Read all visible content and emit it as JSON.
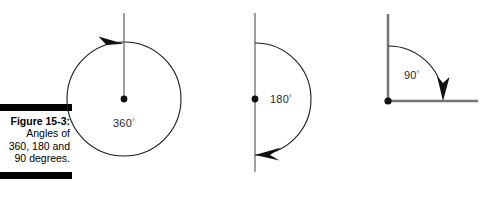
{
  "caption": {
    "title": "Figure 15-3:",
    "lines": [
      "Angles of",
      "360, 180 and",
      "90 degrees."
    ],
    "rule_color": "#000000"
  },
  "figures": [
    {
      "id": "figure-360",
      "name": "full-circle-360",
      "label": "360",
      "degree_symbol": "°",
      "description": "Full circle with vertical radius, center point and clockwise arrowhead at top",
      "geometry": {
        "center_x": 66,
        "center_y": 99,
        "radius": 57,
        "line_top_y": 13,
        "arrow_angle_deg": 100
      }
    },
    {
      "id": "figure-180",
      "name": "half-circle-180",
      "label": "180",
      "degree_symbol": "°",
      "description": "Straight vertical line with semicircular arc bulging right, arrowhead at bottom pointing left",
      "geometry": {
        "center_x": 33,
        "center_y": 99,
        "radius": 56,
        "line_top_y": 13,
        "line_bottom_y": 172
      }
    },
    {
      "id": "figure-90",
      "name": "right-angle-90",
      "label": "90",
      "degree_symbol": "°",
      "description": "Right angle with vertical and horizontal rays, quarter arc with downward arrowhead",
      "geometry": {
        "vertex_x": 18,
        "vertex_y": 101,
        "vertical_top_y": 14,
        "horizontal_right_x": 108,
        "arc_radius": 55
      }
    }
  ],
  "colors": {
    "ink": "#1a1a1a",
    "ray": "#77777a",
    "label": "#2b2b2b",
    "background": "#ffffff"
  }
}
